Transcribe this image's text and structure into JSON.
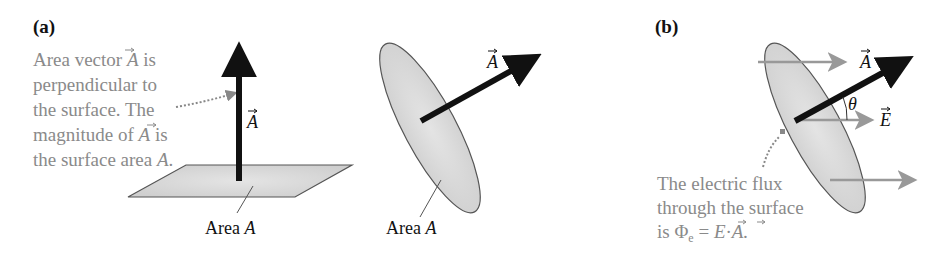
{
  "figure": {
    "panel_a": {
      "label": "(a)",
      "annotation_lines": [
        "Area vector A is",
        "perpendicular to",
        "the surface. The",
        "magnitude of A is",
        "the surface area A."
      ],
      "flat_surface": {
        "vector_label": "A",
        "area_label_text": "Area ",
        "area_label_symbol": "A"
      },
      "tilted_surface": {
        "vector_label": "A",
        "area_label_text": "Area ",
        "area_label_symbol": "A"
      }
    },
    "panel_b": {
      "label": "(b)",
      "vector_A_label": "A",
      "vector_E_label": "E",
      "angle_label": "θ",
      "annotation_lines": [
        "The electric flux",
        "through the surface",
        "is  Φe = E · A."
      ],
      "flux_symbol": "Φ",
      "flux_subscript": "e",
      "equation_rhs_E": "E",
      "equation_dot": "·",
      "equation_rhs_A": "A."
    },
    "colors": {
      "annotation_text": "#8a8a8a",
      "surface_fill": "#d8d8d8",
      "surface_stroke": "#555555",
      "vector_black": "#111111",
      "field_arrow_gray": "#999999"
    }
  }
}
